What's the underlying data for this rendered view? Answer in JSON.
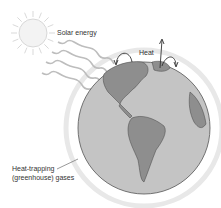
{
  "diagram": {
    "labels": {
      "solar": "Solar energy",
      "heat": "Heat",
      "gases_line1": "Heat-trapping",
      "gases_line2": "(greenhouse) gases"
    },
    "elements": [
      "sun",
      "solar-rays",
      "earth-globe",
      "atmosphere-ring",
      "heat-arrows"
    ],
    "colors": {
      "sun_fill": "#f2f2f2",
      "sun_stroke": "#c8c8c8",
      "ocean": "#c4c4c4",
      "land": "#8e8e8e",
      "atmosphere": "#e6e6e6",
      "text": "#333333"
    }
  }
}
